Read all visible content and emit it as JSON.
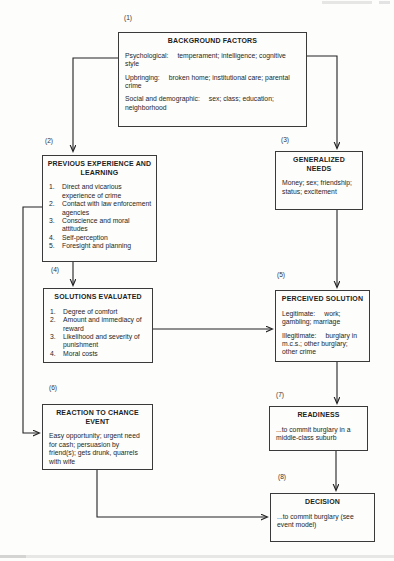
{
  "palette": {
    "background": "#fdfdfc",
    "ink": "#222222",
    "box_border": "#3a3a3a"
  },
  "figure": {
    "boxes": [
      {
        "label": "(1)",
        "title": "BACKGROUND FACTORS",
        "paragraphs": [
          {
            "lead": "Psychological:",
            "rest": "temperament; intelligence; cognitive style"
          },
          {
            "lead": "Upbringing:",
            "rest": "broken home; institutional care; parental crime"
          },
          {
            "lead": "Social and demographic:",
            "rest": "sex; class; education; neighborhood"
          }
        ]
      },
      {
        "label": "(2)",
        "title": "PREVIOUS EXPERIENCE AND LEARNING",
        "items": [
          {
            "num": "1.",
            "text": "Direct and vicarious experience of crime"
          },
          {
            "num": "2.",
            "text": "Contact with law enforcement agencies"
          },
          {
            "num": "3.",
            "text": "Conscience and moral attitudes"
          },
          {
            "num": "4.",
            "text": "Self-perception"
          },
          {
            "num": "5.",
            "text": "Foresight and planning"
          }
        ]
      },
      {
        "label": "(3)",
        "title": "GENERALIZED NEEDS",
        "body": "Money; sex; friendship; status; excitement"
      },
      {
        "label": "(4)",
        "title": "SOLUTIONS EVALUATED",
        "items": [
          {
            "num": "1.",
            "text": "Degree of comfort"
          },
          {
            "num": "2.",
            "text": "Amount and immediacy of reward"
          },
          {
            "num": "3.",
            "text": "Likelihood and severity of punishment"
          },
          {
            "num": "4.",
            "text": "Moral costs"
          }
        ]
      },
      {
        "label": "(5)",
        "title": "PERCEIVED SOLUTION",
        "paragraphs": [
          {
            "lead": "Legitimate:",
            "rest": "work; gambling; marriage"
          },
          {
            "lead": "Illegitimate:",
            "rest": "burglary in m.c.s.; other burglary; other crime"
          }
        ]
      },
      {
        "label": "(6)",
        "title": "REACTION TO CHANCE EVENT",
        "body": "Easy opportunity; urgent need for cash; persuasion by friend(s); gets drunk, quarrels with wife"
      },
      {
        "label": "(7)",
        "title": "READINESS",
        "body": "...to commit burglary in a middle-class suburb"
      },
      {
        "label": "(8)",
        "title": "DECISION",
        "body": "...to commit burglary (see event model)"
      }
    ],
    "edges": [
      {
        "from": "(1)",
        "to": "(2)"
      },
      {
        "from": "(1)",
        "to": "(3)"
      },
      {
        "from": "(2)",
        "to": "(4)"
      },
      {
        "from": "(3)",
        "to": "(5)"
      },
      {
        "from": "(4)",
        "to": "(5)"
      },
      {
        "from": "(2)",
        "to": "(6)"
      },
      {
        "from": "(5)",
        "to": "(7)"
      },
      {
        "from": "(6)",
        "to": "(8)"
      },
      {
        "from": "(7)",
        "to": "(8)"
      }
    ]
  }
}
